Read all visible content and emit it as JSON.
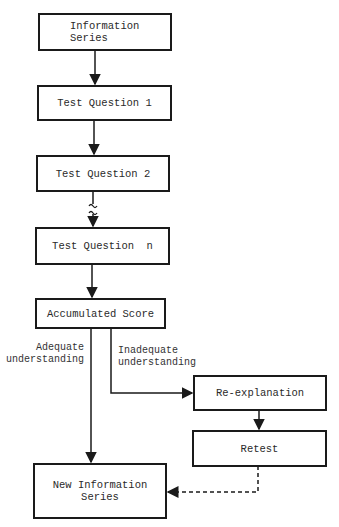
{
  "diagram": {
    "type": "flowchart",
    "nodes": {
      "information_series": {
        "line1": "Information",
        "line2": "Series"
      },
      "test_question_1": "Test Question 1",
      "test_question_2": "Test Question 2",
      "test_question_n": "Test Question  n",
      "accumulated_score": "Accumulated Score",
      "re_explanation": "Re-explanation",
      "retest": "Retest",
      "new_information_series": {
        "line1": "New Information",
        "line2": "Series"
      }
    },
    "edge_labels": {
      "adequate": {
        "line1": "Adequate",
        "line2": "understanding"
      },
      "inadequate": {
        "line1": "Inadequate",
        "line2": "understanding"
      }
    },
    "edges": [
      {
        "from": "information_series",
        "to": "test_question_1",
        "style": "solid"
      },
      {
        "from": "test_question_1",
        "to": "test_question_2",
        "style": "solid"
      },
      {
        "from": "test_question_2",
        "to": "test_question_n",
        "style": "break"
      },
      {
        "from": "test_question_n",
        "to": "accumulated_score",
        "style": "solid"
      },
      {
        "from": "accumulated_score",
        "to": "new_information_series",
        "style": "solid",
        "label": "adequate"
      },
      {
        "from": "accumulated_score",
        "to": "re_explanation",
        "style": "solid",
        "label": "inadequate"
      },
      {
        "from": "re_explanation",
        "to": "retest",
        "style": "solid"
      },
      {
        "from": "retest",
        "to": "new_information_series",
        "style": "dashed"
      }
    ]
  }
}
